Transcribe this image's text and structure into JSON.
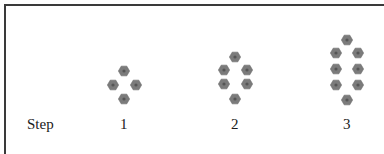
{
  "figure": {
    "row_label": "Step",
    "hex_color": "#7b7b7b",
    "hex_center_color": "#555555",
    "border_color": "#3a3a3a",
    "steps": [
      {
        "label": "1",
        "tile_count": 4,
        "hexagons": [
          [
            124,
            71
          ],
          [
            113,
            85
          ],
          [
            136,
            85
          ],
          [
            124,
            99
          ]
        ]
      },
      {
        "label": "2",
        "tile_count": 6,
        "hexagons": [
          [
            235,
            57
          ],
          [
            224,
            70
          ],
          [
            247,
            70
          ],
          [
            224,
            84
          ],
          [
            247,
            84
          ],
          [
            235,
            99
          ]
        ]
      },
      {
        "label": "3",
        "tile_count": 8,
        "hexagons": [
          [
            347,
            40
          ],
          [
            336,
            53
          ],
          [
            358,
            53
          ],
          [
            336,
            69
          ],
          [
            358,
            69
          ],
          [
            336,
            85
          ],
          [
            358,
            85
          ],
          [
            347,
            100
          ]
        ]
      }
    ]
  }
}
